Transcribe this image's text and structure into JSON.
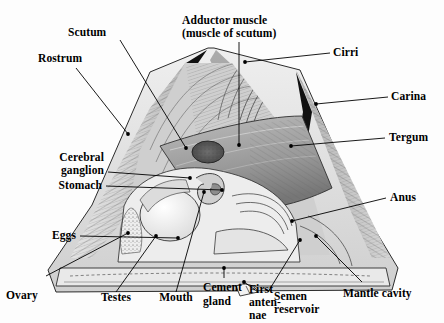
{
  "figure": {
    "type": "anatomical-diagram"
  },
  "labels": {
    "scutum": "Scutum",
    "rostrum": "Rostrum",
    "adductor_line1": "Adductor muscle",
    "adductor_line2": "(muscle of scutum)",
    "cirri": "Cirri",
    "carina": "Carina",
    "tergum": "Tergum",
    "anus": "Anus",
    "cerebral_line1": "Cerebral",
    "cerebral_line2": "ganglion",
    "stomach": "Stomach",
    "eggs": "Eggs",
    "ovary": "Ovary",
    "testes": "Testes",
    "mouth": "Mouth",
    "cement_line1": "Cement",
    "cement_line2": "gland",
    "first_antennae_line1": "First",
    "first_antennae_line2": "anten-",
    "first_antennae_line3": "nae",
    "semen_line1": "Semen",
    "semen_line2": "reservoir",
    "mantle_cavity": "Mantle cavity"
  },
  "colors": {
    "ink": "#000000",
    "paper": "#fdfdfd",
    "shell_light": "#e8e8e8",
    "shell_mid": "#c9c9c9",
    "shell_dark": "#8d8d8d",
    "plate_black": "#141414",
    "body_grey": "#a8a8a8",
    "organ_white": "#f2f2f2"
  }
}
